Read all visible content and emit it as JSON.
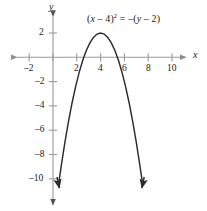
{
  "figure": {
    "background_color": "#ffffff",
    "axis_color": "#9a9a9a",
    "curve_color": "#2b2b2b",
    "text_color": "#1a1a1a",
    "equation_label": "(x – 4)² = –(y – 2)",
    "equation_parts": {
      "open": "(",
      "var_x": "x",
      "minus_h": " – 4)",
      "power": "2",
      "equals": " = –(",
      "var_y": "y",
      "minus_k": " – 2)"
    },
    "x_axis_name": "x",
    "y_axis_name": "y"
  },
  "chart_data": {
    "type": "line",
    "title": "",
    "subtitle": "",
    "xlabel": "x",
    "ylabel": "y",
    "annotations": [
      {
        "text": "(x – 4)² = –(y – 2)",
        "x": 6.2,
        "y": 3.6
      }
    ],
    "legend": [],
    "legend_position": "none",
    "grid": false,
    "xlim": [
      -3.4,
      11.5
    ],
    "ylim": [
      -11.6,
      3.2
    ],
    "x_ticks": [
      -2,
      2,
      4,
      6,
      8,
      10
    ],
    "x_tick_labels": [
      "–2",
      "2",
      "4",
      "6",
      "8",
      "10"
    ],
    "y_ticks": [
      2,
      -2,
      -4,
      -6,
      -8,
      -10
    ],
    "y_tick_labels": [
      "2",
      "–2",
      "–4",
      "–6",
      "–8",
      "–10"
    ],
    "x_ticks_unlabeled": [
      0
    ],
    "equation": "(x - 4)^2 = -(y - 2)",
    "function": "y = 2 - (x - 4)^2",
    "vertex": [
      4,
      2
    ],
    "opens": "down",
    "x_intercepts": [
      2.586,
      5.414
    ],
    "y_intercept": -14,
    "arrowheads": [
      "x-axis-left",
      "x-axis-right",
      "y-axis-up",
      "y-axis-down",
      "curve-left-end",
      "curve-right-end"
    ],
    "series": [
      {
        "name": "(x – 4)² = –(y – 2)",
        "x": [
          0.46,
          0.7,
          1.0,
          1.3,
          1.6,
          1.9,
          2.2,
          2.5,
          2.8,
          3.1,
          3.4,
          3.7,
          4.0,
          4.3,
          4.6,
          4.9,
          5.2,
          5.5,
          5.8,
          6.1,
          6.4,
          6.7,
          7.0,
          7.3,
          7.54
        ],
        "y": [
          -10.5,
          -8.89,
          -7.0,
          -5.29,
          -3.76,
          -2.41,
          -1.24,
          -0.25,
          0.56,
          1.19,
          1.64,
          1.91,
          2.0,
          1.91,
          1.64,
          1.19,
          0.56,
          -0.25,
          -1.24,
          -2.41,
          -3.76,
          -5.29,
          -7.0,
          -8.89,
          -10.5
        ]
      }
    ]
  }
}
